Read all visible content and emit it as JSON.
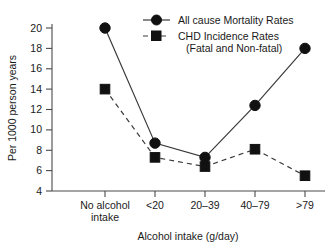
{
  "chart_data": {
    "type": "line",
    "title": "",
    "xlabel": "Alcohol intake (g/day)",
    "ylabel": "Per 1000 person years",
    "categories": [
      "No alcohol intake",
      "<20",
      "20–39",
      "40–79",
      ">79"
    ],
    "category_lines": [
      [
        "No alcohol",
        "intake"
      ],
      [
        "<20"
      ],
      [
        "20–39"
      ],
      [
        "40–79"
      ],
      [
        ">79"
      ]
    ],
    "ylim": [
      4,
      20
    ],
    "yticks": [
      4,
      6,
      8,
      10,
      12,
      14,
      16,
      18,
      20
    ],
    "ytick_labels": [
      "4",
      "6",
      "8",
      "10",
      "12",
      "14",
      "16",
      "18",
      "20"
    ],
    "grid": false,
    "legend_position": "top-right",
    "series": [
      {
        "name": "All cause Mortality Rates",
        "marker": "circle",
        "linestyle": "solid",
        "color": "#111111",
        "values": [
          20.0,
          8.7,
          7.3,
          12.4,
          18.0
        ]
      },
      {
        "name": "CHD Incidence Rates (Fatal and Non-fatal)",
        "marker": "square",
        "linestyle": "dashed",
        "color": "#111111",
        "values": [
          14.0,
          7.3,
          6.4,
          8.1,
          5.5
        ]
      }
    ]
  },
  "legend": {
    "entries": [
      {
        "label": "All cause Mortality Rates",
        "sublabel": ""
      },
      {
        "label": "CHD Incidence Rates",
        "sublabel": "(Fatal and Non-fatal)"
      }
    ]
  },
  "axes": {
    "y_title": "Per 1000 person years",
    "x_title": "Alcohol intake (g/day)"
  }
}
